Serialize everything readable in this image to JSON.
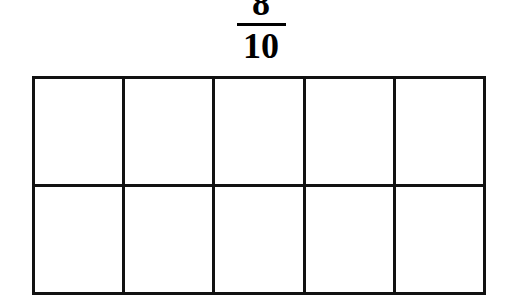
{
  "problem": {
    "fraction": {
      "numerator": "8",
      "denominator": "10",
      "display": "8/10"
    }
  },
  "chart_data": {
    "type": "table",
    "title": "8/10",
    "rows": 2,
    "columns": 5,
    "total_cells": 10,
    "shaded_cells": 0,
    "unshaded_cells": 10,
    "cells": [
      [
        {
          "row": 1,
          "col": 1,
          "shaded": false
        },
        {
          "row": 1,
          "col": 2,
          "shaded": false
        },
        {
          "row": 1,
          "col": 3,
          "shaded": false
        },
        {
          "row": 1,
          "col": 4,
          "shaded": false
        },
        {
          "row": 1,
          "col": 5,
          "shaded": false
        }
      ],
      [
        {
          "row": 2,
          "col": 1,
          "shaded": false
        },
        {
          "row": 2,
          "col": 2,
          "shaded": false
        },
        {
          "row": 2,
          "col": 3,
          "shaded": false
        },
        {
          "row": 2,
          "col": 4,
          "shaded": false
        },
        {
          "row": 2,
          "col": 5,
          "shaded": false
        }
      ]
    ],
    "colors": {
      "line": "#111111",
      "background": "#ffffff",
      "text": "#000000"
    }
  }
}
